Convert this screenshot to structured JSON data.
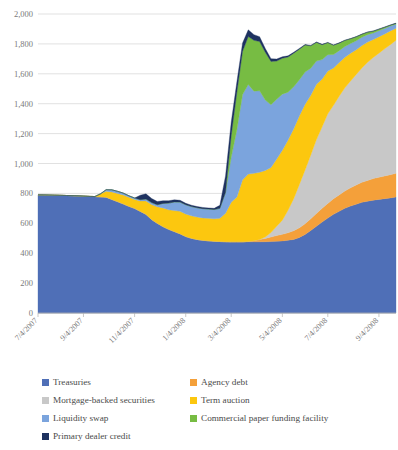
{
  "chart_data": {
    "type": "area",
    "stacked": true,
    "title": "",
    "xlabel": "",
    "ylabel": "",
    "ylim": [
      0,
      2000
    ],
    "ytick_step": 200,
    "ytick_labels": [
      "0",
      "200",
      "400",
      "600",
      "800",
      "1,000",
      "1,200",
      "1,400",
      "1,600",
      "1,800",
      "2,000"
    ],
    "ytick_values": [
      0,
      200,
      400,
      600,
      800,
      1000,
      1200,
      1400,
      1600,
      1800,
      2000
    ],
    "grid": true,
    "legend_position": "bottom",
    "legend_columns": 2,
    "xtick_labels": [
      "7/4/2007",
      "9/4/2007",
      "11/4/2007",
      "1/4/2008",
      "3/4/2008",
      "5/4/2008",
      "7/4/2008",
      "9/4/2008",
      "11/4/2008",
      "1/4/2009",
      "3/4/2009",
      "5/4/2009",
      "7/4/2009",
      "9/4/2009",
      "11/4/2009"
    ],
    "xtick_indices": [
      0,
      8,
      17,
      26,
      34,
      43,
      51,
      60,
      69,
      77,
      86,
      94,
      103,
      112,
      120
    ],
    "x": [
      "7/4/2007",
      "7/18/2007",
      "8/1/2007",
      "8/15/2007",
      "8/29/2007",
      "9/12/2007",
      "9/26/2007",
      "10/10/2007",
      "10/24/2007",
      "11/7/2007",
      "11/21/2007",
      "12/5/2007",
      "12/19/2007",
      "1/2/2008",
      "1/16/2008",
      "1/30/2008",
      "2/13/2008",
      "2/27/2008",
      "3/12/2008",
      "3/26/2008",
      "4/9/2008",
      "4/23/2008",
      "5/7/2008",
      "5/21/2008",
      "6/4/2008",
      "6/18/2008",
      "7/2/2008",
      "7/16/2008",
      "7/30/2008",
      "8/13/2008",
      "8/27/2008",
      "9/10/2008",
      "9/24/2008",
      "10/8/2008",
      "10/22/2008",
      "11/5/2008",
      "11/19/2008",
      "12/3/2008",
      "12/17/2008",
      "12/31/2008",
      "1/14/2009",
      "1/28/2009",
      "2/11/2009",
      "2/25/2009",
      "3/11/2009",
      "3/25/2009",
      "4/8/2009",
      "4/22/2009",
      "5/6/2009",
      "5/20/2009",
      "6/3/2009",
      "6/17/2009",
      "7/1/2009",
      "7/15/2009",
      "7/29/2009",
      "8/12/2009",
      "8/26/2009",
      "9/9/2009",
      "9/23/2009",
      "10/7/2009",
      "10/21/2009",
      "11/4/2009",
      "11/18/2009",
      "12/2/2009"
    ],
    "series": [
      {
        "name": "Treasuries",
        "color": "#4f6fb7",
        "values": [
          790,
          790,
          789,
          788,
          787,
          786,
          785,
          784,
          782,
          780,
          779,
          777,
          775,
          760,
          745,
          730,
          714,
          700,
          680,
          660,
          625,
          600,
          578,
          560,
          545,
          530,
          512,
          500,
          492,
          486,
          483,
          480,
          478,
          477,
          476,
          476,
          476,
          476,
          476,
          476,
          477,
          478,
          480,
          482,
          487,
          492,
          505,
          525,
          552,
          580,
          608,
          635,
          660,
          680,
          700,
          715,
          728,
          740,
          748,
          755,
          760,
          765,
          770,
          776
        ]
      },
      {
        "name": "Agency debt",
        "color": "#f4a03a",
        "values": [
          0,
          0,
          0,
          0,
          0,
          0,
          0,
          0,
          0,
          0,
          0,
          0,
          0,
          0,
          0,
          0,
          0,
          0,
          0,
          0,
          0,
          0,
          0,
          0,
          0,
          0,
          0,
          0,
          0,
          0,
          0,
          0,
          0,
          0,
          0,
          0,
          0,
          3,
          8,
          15,
          22,
          30,
          38,
          44,
          50,
          58,
          65,
          72,
          78,
          85,
          92,
          98,
          104,
          110,
          116,
          122,
          128,
          134,
          139,
          144,
          148,
          152,
          155,
          158
        ]
      },
      {
        "name": "Mortgage-backed securities",
        "color": "#c8c8c8",
        "values": [
          0,
          0,
          0,
          0,
          0,
          0,
          0,
          0,
          0,
          0,
          0,
          0,
          0,
          0,
          0,
          0,
          0,
          0,
          0,
          0,
          0,
          0,
          0,
          0,
          0,
          0,
          0,
          0,
          0,
          0,
          0,
          0,
          0,
          0,
          0,
          0,
          0,
          0,
          0,
          0,
          10,
          30,
          62,
          95,
          150,
          215,
          290,
          360,
          427,
          495,
          545,
          600,
          625,
          660,
          690,
          715,
          740,
          765,
          790,
          810,
          830,
          850,
          870,
          890
        ]
      },
      {
        "name": "Term auction",
        "color": "#fcc70f",
        "values": [
          0,
          0,
          0,
          0,
          0,
          0,
          0,
          0,
          0,
          0,
          0,
          20,
          40,
          50,
          55,
          60,
          60,
          60,
          70,
          90,
          100,
          110,
          125,
          130,
          140,
          150,
          150,
          150,
          150,
          150,
          150,
          150,
          155,
          190,
          265,
          300,
          415,
          450,
          450,
          450,
          445,
          435,
          450,
          468,
          470,
          468,
          460,
          440,
          400,
          370,
          320,
          285,
          250,
          225,
          205,
          185,
          165,
          150,
          135,
          120,
          110,
          100,
          92,
          80
        ]
      },
      {
        "name": "Liquidity swap",
        "color": "#7ba4dd",
        "values": [
          0,
          0,
          0,
          0,
          0,
          0,
          0,
          0,
          0,
          0,
          0,
          0,
          10,
          14,
          14,
          12,
          10,
          9,
          8,
          12,
          14,
          14,
          30,
          45,
          58,
          62,
          62,
          62,
          62,
          62,
          62,
          62,
          67,
          140,
          300,
          450,
          570,
          600,
          550,
          545,
          470,
          420,
          400,
          375,
          320,
          280,
          240,
          215,
          180,
          155,
          130,
          110,
          90,
          80,
          72,
          65,
          60,
          55,
          50,
          44,
          40,
          36,
          32,
          28
        ]
      },
      {
        "name": "Commercial paper funding facility",
        "color": "#77bc43",
        "values": [
          0,
          0,
          0,
          0,
          0,
          0,
          0,
          0,
          0,
          0,
          0,
          0,
          0,
          0,
          0,
          0,
          0,
          0,
          0,
          0,
          0,
          0,
          0,
          0,
          0,
          0,
          0,
          0,
          0,
          0,
          0,
          0,
          0,
          0,
          145,
          250,
          290,
          320,
          340,
          330,
          320,
          290,
          255,
          240,
          235,
          225,
          205,
          180,
          150,
          125,
          100,
          80,
          62,
          50,
          40,
          32,
          26,
          20,
          16,
          12,
          10,
          8,
          6,
          5
        ]
      },
      {
        "name": "Primary dealer credit",
        "color": "#1e3260",
        "values": [
          0,
          0,
          0,
          0,
          0,
          0,
          0,
          0,
          0,
          0,
          0,
          0,
          0,
          0,
          0,
          0,
          0,
          0,
          30,
          35,
          27,
          22,
          18,
          16,
          14,
          12,
          10,
          9,
          8,
          8,
          8,
          8,
          20,
          110,
          90,
          70,
          55,
          45,
          38,
          32,
          25,
          18,
          14,
          10,
          8,
          6,
          5,
          4,
          3,
          3,
          2,
          2,
          2,
          2,
          2,
          2,
          2,
          2,
          2,
          2,
          2,
          2,
          2,
          2
        ]
      }
    ]
  },
  "legend": {
    "items": [
      {
        "label": "Treasuries",
        "color": "#4f6fb7"
      },
      {
        "label": "Agency debt",
        "color": "#f4a03a"
      },
      {
        "label": "Mortgage-backed securities",
        "color": "#c8c8c8"
      },
      {
        "label": "Term auction",
        "color": "#fcc70f"
      },
      {
        "label": "Liquidity swap",
        "color": "#7ba4dd"
      },
      {
        "label": "Commercial paper funding facility",
        "color": "#77bc43"
      },
      {
        "label": "Primary dealer credit",
        "color": "#1e3260"
      }
    ]
  }
}
